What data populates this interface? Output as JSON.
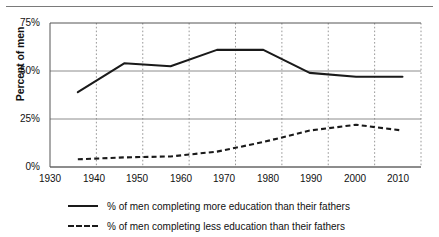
{
  "figure": {
    "has_top_rule": true,
    "background_color": "#ffffff",
    "line_color": "#1a1a1a",
    "grid_color": "#8c8c8c"
  },
  "chart_data": {
    "type": "line",
    "title": "",
    "xlabel": "",
    "ylabel": "Percent of men",
    "xlim": [
      1930,
      2010
    ],
    "ylim": [
      0,
      75
    ],
    "xticks": [
      1930,
      1940,
      1950,
      1960,
      1970,
      1980,
      1990,
      2000,
      2010
    ],
    "xtick_labels": [
      "1930",
      "1940",
      "1950",
      "1960",
      "1970",
      "1980",
      "1990",
      "2000",
      "2010"
    ],
    "yticks": [
      0,
      25,
      50,
      75
    ],
    "ytick_labels": [
      "0%",
      "25%",
      "50%",
      "75%"
    ],
    "grid": "horizontal solid at y-ticks, vertical dotted at x-ticks",
    "legend_position": "below plot, left aligned",
    "series": [
      {
        "name": "% of men completing more education than their fathers",
        "style": "solid",
        "x": [
          1936,
          1946,
          1956,
          1966,
          1976,
          1986,
          1996,
          2006
        ],
        "values": [
          39,
          54,
          52.5,
          61,
          61,
          49,
          47,
          47
        ]
      },
      {
        "name": "% of men completing less education than their fathers",
        "style": "dashed",
        "x": [
          1936,
          1946,
          1956,
          1966,
          1976,
          1986,
          1996,
          2006
        ],
        "values": [
          4,
          5,
          5.5,
          8,
          13,
          19,
          22,
          19
        ]
      }
    ]
  },
  "legend": {
    "items": [
      {
        "label": "% of men completing more education than their fathers",
        "style": "solid"
      },
      {
        "label": "% of men completing less education than their fathers",
        "style": "dashed"
      }
    ]
  }
}
